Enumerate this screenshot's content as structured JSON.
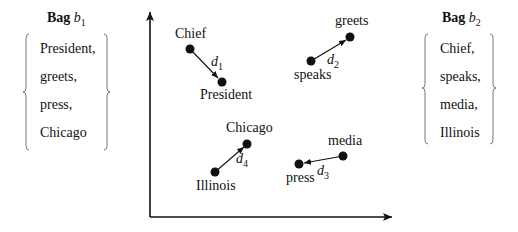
{
  "bags": [
    {
      "title_word": "Bag",
      "title_var": "b",
      "title_sub": "1",
      "items": [
        "President,",
        "greets,",
        "press,",
        "Chicago"
      ]
    },
    {
      "title_word": "Bag",
      "title_var": "b",
      "title_sub": "2",
      "items": [
        "Chief,",
        "speaks,",
        "media,",
        "Illinois"
      ]
    }
  ],
  "points": {
    "chief": "Chief",
    "president": "President",
    "greets": "greets",
    "speaks": "speaks",
    "chicago": "Chicago",
    "illinois": "Illinois",
    "media": "media",
    "press": "press"
  },
  "distances": [
    {
      "var": "d",
      "sub": "1"
    },
    {
      "var": "d",
      "sub": "2"
    },
    {
      "var": "d",
      "sub": "3"
    },
    {
      "var": "d",
      "sub": "4"
    }
  ]
}
